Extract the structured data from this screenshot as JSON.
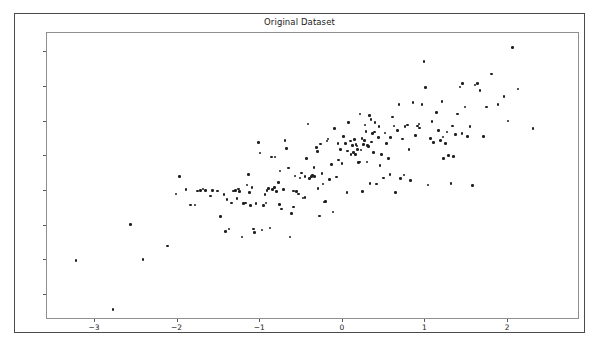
{
  "chart_data": {
    "type": "scatter",
    "title": "Original Dataset",
    "xlabel": "",
    "ylabel": "",
    "xlim": [
      -3.58,
      2.87
    ],
    "ylim": [
      -118,
      89
    ],
    "xticks": [
      -3,
      -2,
      -1,
      0,
      1,
      2
    ],
    "xtick_labels": [
      "−3",
      "−2",
      "−1",
      "0",
      "1",
      "2"
    ],
    "yticks": [
      75,
      50,
      25,
      0,
      -25,
      -50,
      -75,
      -100
    ],
    "ytick_labels": [
      "75",
      "50",
      "25",
      "0",
      "−25",
      "−50",
      "−75",
      "−100"
    ],
    "grid": false,
    "legend": null,
    "marker": "circle",
    "marker_color": "#1f1f1f",
    "marker_size": 2.6,
    "n_points": 200,
    "points": [
      [
        -3.23,
        -75.0
      ],
      [
        -2.78,
        -110.5
      ],
      [
        -2.57,
        -49.0
      ],
      [
        -2.42,
        -74.5
      ],
      [
        -2.12,
        -64.5
      ],
      [
        -2.02,
        -27.0
      ],
      [
        -1.98,
        -14.5
      ],
      [
        -1.9,
        -24.0
      ],
      [
        -1.84,
        -35.0
      ],
      [
        -1.79,
        -35.0
      ],
      [
        -1.76,
        -25.0
      ],
      [
        -1.72,
        -24.5
      ],
      [
        -1.69,
        -23.5
      ],
      [
        -1.66,
        -24.5
      ],
      [
        -1.6,
        -28.5
      ],
      [
        -1.58,
        -24.5
      ],
      [
        -1.52,
        -25.0
      ],
      [
        -1.48,
        -43.5
      ],
      [
        -1.42,
        -54.0
      ],
      [
        -1.4,
        -31.0
      ],
      [
        -1.38,
        -52.5
      ],
      [
        -1.35,
        -33.5
      ],
      [
        -1.32,
        -25.0
      ],
      [
        -1.3,
        -24.5
      ],
      [
        -1.28,
        -30.5
      ],
      [
        -1.26,
        -23.5
      ],
      [
        -1.22,
        -58.0
      ],
      [
        -1.2,
        -34.0
      ],
      [
        -1.18,
        -33.5
      ],
      [
        -1.16,
        -20.5
      ],
      [
        -1.14,
        -13.0
      ],
      [
        -1.12,
        -35.5
      ],
      [
        -1.1,
        -22.5
      ],
      [
        -1.08,
        -52.5
      ],
      [
        -1.07,
        -55.0
      ],
      [
        -1.05,
        -34.0
      ],
      [
        -1.02,
        10.0
      ],
      [
        -1.0,
        2.5
      ],
      [
        -0.98,
        -53.0
      ],
      [
        -0.96,
        -35.5
      ],
      [
        -0.94,
        -27.5
      ],
      [
        -0.92,
        -24.5
      ],
      [
        -0.9,
        -23.0
      ],
      [
        -0.88,
        -51.5
      ],
      [
        -0.86,
        -0.5
      ],
      [
        -0.85,
        -24.0
      ],
      [
        -0.83,
        -22.5
      ],
      [
        -0.82,
        -0.5
      ],
      [
        -0.8,
        -25.5
      ],
      [
        -0.78,
        -19.0
      ],
      [
        -0.76,
        -10.5
      ],
      [
        -0.74,
        -38.0
      ],
      [
        -0.72,
        -24.0
      ],
      [
        -0.7,
        11.5
      ],
      [
        -0.68,
        5.5
      ],
      [
        -0.66,
        -8.5
      ],
      [
        -0.64,
        -58.0
      ],
      [
        -0.62,
        -41.0
      ],
      [
        -0.6,
        -36.5
      ],
      [
        -0.58,
        -14.0
      ],
      [
        -0.56,
        -25.5
      ],
      [
        -0.54,
        -27.0
      ],
      [
        -0.52,
        -15.5
      ],
      [
        -0.5,
        -12.0
      ],
      [
        -0.48,
        -30.0
      ],
      [
        -0.46,
        -29.5
      ],
      [
        -0.44,
        -1.5
      ],
      [
        -0.42,
        23.5
      ],
      [
        -0.4,
        -16.0
      ],
      [
        -0.38,
        -14.5
      ],
      [
        -0.37,
        -13.5
      ],
      [
        -0.35,
        -8.0
      ],
      [
        -0.34,
        -14.5
      ],
      [
        -0.32,
        6.5
      ],
      [
        -0.31,
        3.5
      ],
      [
        -0.3,
        -23.0
      ],
      [
        -0.28,
        -43.0
      ],
      [
        -0.27,
        9.0
      ],
      [
        -0.25,
        -12.5
      ],
      [
        -0.24,
        -20.0
      ],
      [
        -0.22,
        -33.0
      ],
      [
        -0.21,
        -32.5
      ],
      [
        -0.19,
        11.0
      ],
      [
        -0.18,
        12.5
      ],
      [
        -0.16,
        -16.5
      ],
      [
        -0.14,
        -6.0
      ],
      [
        -0.12,
        -40.0
      ],
      [
        -0.1,
        20.0
      ],
      [
        -0.08,
        -15.0
      ],
      [
        -0.06,
        9.5
      ],
      [
        -0.05,
        -2.5
      ],
      [
        -0.03,
        5.0
      ],
      [
        -0.01,
        -5.0
      ],
      [
        0.01,
        14.5
      ],
      [
        0.03,
        9.5
      ],
      [
        0.05,
        -26.0
      ],
      [
        0.07,
        24.5
      ],
      [
        0.09,
        11.0
      ],
      [
        0.1,
        1.5
      ],
      [
        0.12,
        8.0
      ],
      [
        0.13,
        3.0
      ],
      [
        0.15,
        1.5
      ],
      [
        0.16,
        8.5
      ],
      [
        0.17,
        7.5
      ],
      [
        0.18,
        5.0
      ],
      [
        0.19,
        -4.5
      ],
      [
        0.2,
        -4.0
      ],
      [
        0.21,
        30.5
      ],
      [
        0.22,
        4.5
      ],
      [
        0.23,
        13.0
      ],
      [
        0.24,
        -25.5
      ],
      [
        0.25,
        8.5
      ],
      [
        0.26,
        11.5
      ],
      [
        0.27,
        22.5
      ],
      [
        0.28,
        18.0
      ],
      [
        0.29,
        -4.0
      ],
      [
        0.3,
        8.0
      ],
      [
        0.32,
        29.5
      ],
      [
        0.33,
        -19.5
      ],
      [
        0.34,
        26.5
      ],
      [
        0.35,
        10.5
      ],
      [
        0.36,
        16.5
      ],
      [
        0.37,
        3.0
      ],
      [
        0.39,
        24.5
      ],
      [
        0.41,
        -20.0
      ],
      [
        0.43,
        13.5
      ],
      [
        0.45,
        -6.5
      ],
      [
        0.47,
        1.5
      ],
      [
        0.49,
        -15.5
      ],
      [
        0.51,
        17.0
      ],
      [
        0.53,
        9.5
      ],
      [
        0.55,
        -1.5
      ],
      [
        0.57,
        -13.0
      ],
      [
        0.6,
        28.5
      ],
      [
        0.62,
        22.0
      ],
      [
        0.64,
        -26.0
      ],
      [
        0.66,
        18.5
      ],
      [
        0.68,
        37.5
      ],
      [
        0.7,
        -16.0
      ],
      [
        0.72,
        12.5
      ],
      [
        0.75,
        21.5
      ],
      [
        0.78,
        22.5
      ],
      [
        0.8,
        5.0
      ],
      [
        0.82,
        -17.5
      ],
      [
        0.85,
        39.0
      ],
      [
        0.88,
        15.0
      ],
      [
        0.9,
        22.0
      ],
      [
        0.93,
        20.5
      ],
      [
        0.96,
        37.5
      ],
      [
        0.98,
        68.5
      ],
      [
        1.0,
        49.5
      ],
      [
        1.03,
        -20.5
      ],
      [
        1.06,
        13.0
      ],
      [
        1.1,
        10.0
      ],
      [
        1.13,
        31.5
      ],
      [
        1.16,
        18.5
      ],
      [
        1.18,
        11.5
      ],
      [
        1.2,
        39.5
      ],
      [
        1.22,
        -1.5
      ],
      [
        1.24,
        9.5
      ],
      [
        1.26,
        17.5
      ],
      [
        1.28,
        0.5
      ],
      [
        1.31,
        -19.5
      ],
      [
        1.34,
        0.0
      ],
      [
        1.36,
        16.0
      ],
      [
        1.39,
        30.5
      ],
      [
        1.42,
        50.0
      ],
      [
        1.45,
        52.5
      ],
      [
        1.48,
        35.5
      ],
      [
        1.51,
        14.5
      ],
      [
        1.54,
        21.5
      ],
      [
        1.57,
        -21.0
      ],
      [
        1.6,
        51.5
      ],
      [
        1.63,
        52.5
      ],
      [
        1.66,
        47.5
      ],
      [
        1.7,
        14.5
      ],
      [
        1.74,
        35.5
      ],
      [
        1.8,
        59.5
      ],
      [
        1.88,
        37.5
      ],
      [
        1.95,
        43.0
      ],
      [
        2.0,
        25.5
      ],
      [
        2.05,
        78.5
      ],
      [
        2.12,
        48.5
      ],
      [
        2.3,
        20.0
      ],
      [
        -1.44,
        -27.5
      ],
      [
        -1.25,
        -25.5
      ],
      [
        -0.93,
        -33.5
      ],
      [
        -0.6,
        -25.0
      ],
      [
        -0.35,
        -14.0
      ],
      [
        0.06,
        4.0
      ],
      [
        0.14,
        12.0
      ],
      [
        0.31,
        7.0
      ],
      [
        0.38,
        17.5
      ],
      [
        0.58,
        13.5
      ],
      [
        0.74,
        -13.5
      ],
      [
        0.92,
        23.5
      ],
      [
        1.08,
        25.0
      ],
      [
        1.21,
        14.0
      ],
      [
        1.33,
        22.0
      ],
      [
        1.44,
        16.5
      ],
      [
        -1.13,
        -26.0
      ],
      [
        -0.77,
        -34.5
      ],
      [
        -0.46,
        -14.5
      ],
      [
        0.44,
        21.5
      ]
    ]
  }
}
